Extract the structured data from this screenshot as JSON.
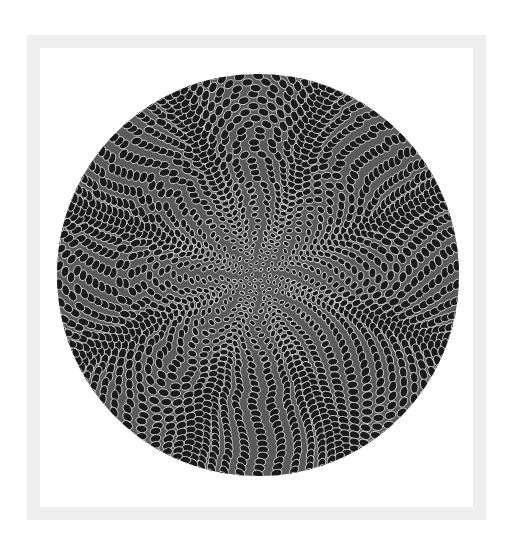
{
  "image": {
    "description": "Circular op-art pattern of black elliptical cells with light gray outlines on dark gray disc, arranged in swirling spiral arms, framed by a light gray square border",
    "background_color": "#ffffff",
    "frame": {
      "color": "#efefef",
      "thickness": 13
    },
    "disc": {
      "cx": 258,
      "cy": 275,
      "r": 201,
      "fill": "#5a5a5a",
      "cell_fill": "#1a1a1a",
      "cell_stroke": "#d4d4d4",
      "rings": 34,
      "spiral_arms": 8,
      "twist": 2.4
    }
  }
}
